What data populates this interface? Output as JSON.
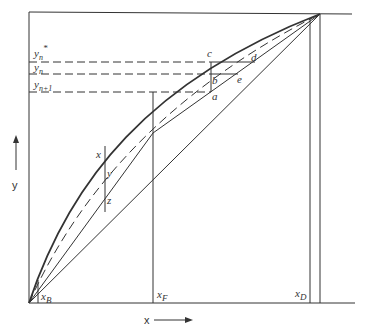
{
  "diagram": {
    "type": "McCabe-Thiele distillation diagram",
    "axes": {
      "x_label": "x",
      "y_label": "y"
    },
    "y_levels": [
      {
        "id": "yn_star",
        "label": "y",
        "sub": "n",
        "sup": "*"
      },
      {
        "id": "yn",
        "label": "y",
        "sub": "n"
      },
      {
        "id": "yn1",
        "label": "y",
        "sub": "n+1"
      }
    ],
    "points": {
      "a": "a",
      "b": "b",
      "c": "c",
      "d": "d",
      "e": "e"
    },
    "xyz": {
      "x": "x",
      "y": "y",
      "z": "z"
    },
    "x_marks": [
      {
        "id": "xB",
        "label": "x",
        "sub": "B"
      },
      {
        "id": "xF",
        "label": "x",
        "sub": "F"
      },
      {
        "id": "xD",
        "label": "x",
        "sub": "D"
      }
    ],
    "colors": {
      "line": "#333333",
      "background": "#ffffff"
    }
  }
}
